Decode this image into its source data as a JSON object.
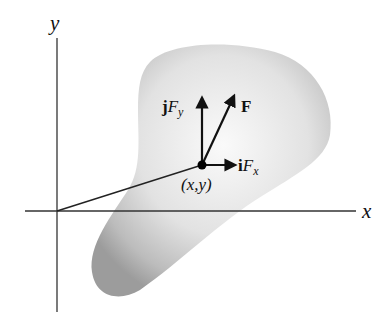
{
  "diagram": {
    "axes": {
      "x_label": "x",
      "y_label": "y"
    },
    "point": {
      "label": "(x,y)"
    },
    "vectors": {
      "resultant": {
        "bold": "F",
        "label": "F"
      },
      "y_component": {
        "unit": "j",
        "symbol": "F",
        "subscript": "y"
      },
      "x_component": {
        "unit": "i",
        "symbol": "F",
        "subscript": "x"
      }
    },
    "colors": {
      "body_light": "#f4f4f4",
      "body_dark": "#9a9a9a",
      "line": "#222222"
    }
  }
}
